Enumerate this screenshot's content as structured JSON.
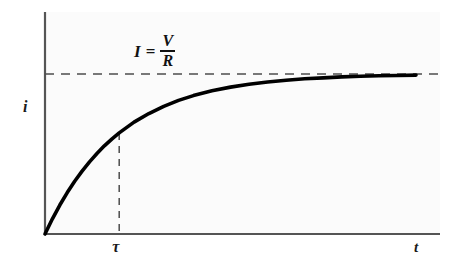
{
  "figure": {
    "background_color": "#ffffff",
    "plot_background_color": "#fbfbfb",
    "axis_color": "#555555",
    "curve_color": "#000000",
    "dashed_color": "#4d4d4d"
  },
  "labels": {
    "y_axis": "i",
    "x_axis": "t",
    "tau_tick": "τ",
    "equation_lhs": "I",
    "equation_sign": "=",
    "equation_numerator": "V",
    "equation_denominator": "R"
  },
  "chart_data": {
    "type": "line",
    "title": "",
    "subtitle": "",
    "xlabel": "t",
    "ylabel": "i",
    "grid": false,
    "legend": "none",
    "annotations": [
      {
        "name": "asymptote-equation",
        "text": "I = V/R",
        "kind": "horizontal-asymptote-label",
        "y_value": 1.0
      },
      {
        "name": "tau-marker",
        "text": "τ",
        "kind": "vertical-dashed-marker",
        "x_value": 1.0,
        "y_value": 0.632
      }
    ],
    "xlim": [
      0,
      5
    ],
    "ylim": [
      0,
      1.08
    ],
    "xticks": [
      1
    ],
    "xticklabels": [
      "τ"
    ],
    "yticks": [],
    "yticklabels": [],
    "series": [
      {
        "name": "i(t) = I(1 - e^(-t/τ))",
        "x": [
          0,
          0.1,
          0.2,
          0.3,
          0.4,
          0.5,
          0.6,
          0.7,
          0.8,
          0.9,
          1.0,
          1.2,
          1.4,
          1.6,
          1.8,
          2.0,
          2.25,
          2.5,
          2.75,
          3.0,
          3.25,
          3.5,
          3.75,
          4.0,
          4.25,
          4.5,
          4.75,
          5.0
        ],
        "y": [
          0,
          0.095,
          0.181,
          0.259,
          0.33,
          0.393,
          0.451,
          0.503,
          0.551,
          0.593,
          0.632,
          0.699,
          0.753,
          0.798,
          0.835,
          0.865,
          0.895,
          0.918,
          0.936,
          0.95,
          0.961,
          0.97,
          0.976,
          0.982,
          0.986,
          0.989,
          0.991,
          0.993
        ]
      }
    ],
    "asymptote": {
      "name": "steady-state-current",
      "label": "I = V/R",
      "y": 1.0,
      "style": "dashed"
    }
  }
}
